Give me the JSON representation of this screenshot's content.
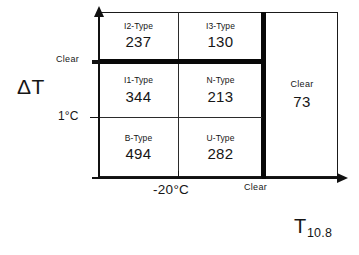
{
  "chart_data": {
    "type": "table",
    "title": "",
    "xlabel": "T10.8",
    "ylabel": "ΔT",
    "x_axis": {
      "label_main": "T",
      "label_sub": "10.8",
      "ticks": [
        {
          "text": "-20°C",
          "kind": "thin"
        },
        {
          "text": "Clear",
          "kind": "thick"
        }
      ]
    },
    "y_axis": {
      "label": "ΔT",
      "ticks": [
        {
          "text": "Clear",
          "kind": "thick"
        },
        {
          "text": "1°C",
          "kind": "thin"
        }
      ]
    },
    "cells": [
      {
        "id": "r1c1",
        "type": "I2-Type",
        "count": "237"
      },
      {
        "id": "r1c2",
        "type": "I3-Type",
        "count": "130"
      },
      {
        "id": "r2c1",
        "type": "I1-Type",
        "count": "344"
      },
      {
        "id": "r2c2",
        "type": "N-Type",
        "count": "213"
      },
      {
        "id": "r3c1",
        "type": "B-Type",
        "count": "494"
      },
      {
        "id": "r3c2",
        "type": "U-Type",
        "count": "282"
      }
    ],
    "right_panel": {
      "type": "Clear",
      "count": "73"
    },
    "colors": {
      "line": "#1a1a1a",
      "thick_line": "#080808",
      "text": "#161616",
      "background": "#ffffff"
    }
  }
}
